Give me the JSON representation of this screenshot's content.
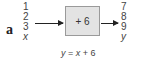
{
  "diagram": {
    "label": "a",
    "inputs": [
      "1",
      "2",
      "3"
    ],
    "input_var": "x",
    "operation": "+ 6",
    "outputs": [
      "7",
      "8",
      "9"
    ],
    "output_var": "y",
    "formula": {
      "lhs": "y",
      "eq": " = ",
      "var": "x",
      "rest": " + 6"
    },
    "colors": {
      "box_fill": "#e3e3e3",
      "box_border": "#9a9a9a",
      "arrow": "#222222"
    }
  }
}
